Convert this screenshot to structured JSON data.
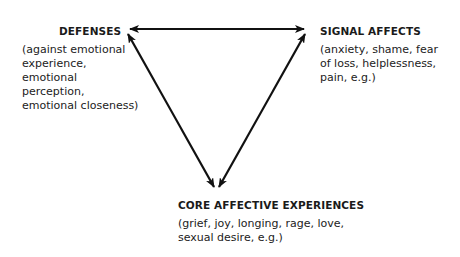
{
  "diagram": {
    "type": "triangle-of-conflict",
    "nodes": [
      {
        "id": "defenses",
        "title": "DEFENSES",
        "description": "(against emotional experience, emotional perception, emotional closeness)"
      },
      {
        "id": "signal_affects",
        "title": "SIGNAL AFFECTS",
        "description": "(anxiety, shame, fear of loss, helplessness, pain, e.g.)"
      },
      {
        "id": "core_affective_experiences",
        "title": "CORE AFFECTIVE EXPERIENCES",
        "description": "(grief, joy, longing, rage, love, sexual desire, e.g.)"
      }
    ],
    "edges": [
      {
        "from": "defenses",
        "to": "signal_affects",
        "direction": "bidirectional"
      },
      {
        "from": "defenses",
        "to": "core_affective_experiences",
        "direction": "bidirectional"
      },
      {
        "from": "signal_affects",
        "to": "core_affective_experiences",
        "direction": "bidirectional"
      }
    ],
    "colors": {
      "line": "#111111",
      "text": "#1a1a1a",
      "background": "#ffffff"
    }
  }
}
